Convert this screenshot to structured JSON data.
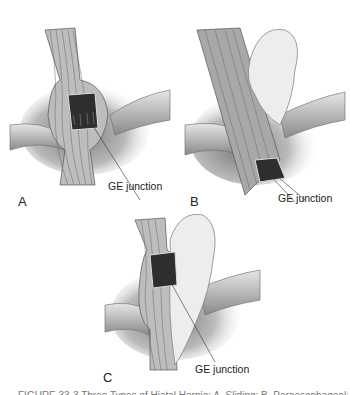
{
  "figure": {
    "panels": [
      {
        "id": "A",
        "label": "A",
        "callout": "GE junction"
      },
      {
        "id": "B",
        "label": "B",
        "callout": "GE junction"
      },
      {
        "id": "C",
        "label": "C",
        "callout": "GE junction"
      }
    ],
    "caption": "FIGURE 33-3 Three Types of Hiatal Hernia: A, Sliding; B, Paraesophageal; C, Mixed"
  },
  "colors": {
    "tissue_dark": "#555555",
    "tissue_mid": "#9a9a9a",
    "tissue_light": "#d8d8d8",
    "mucosa": "#2e2e2e",
    "text": "#222222"
  }
}
